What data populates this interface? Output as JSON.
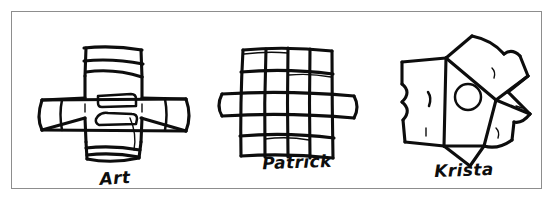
{
  "image": {
    "kind": "scanned-handdrawn-figure",
    "background_color": "#ffffff",
    "ink_color": "#0d0d0d",
    "frame_color": "#8d8d8d",
    "description": "Three hand-drawn puzzle-piece sketches in a thin rectangular frame, each with a handwritten name beneath it."
  },
  "figures": [
    {
      "id": "art",
      "caption": "Art",
      "shape": "plus-cross with horizontal bands and inner rounded rectangles"
    },
    {
      "id": "patrick",
      "caption": "Patrick",
      "shape": "four-by-four grid of squares with side tabs left and right"
    },
    {
      "id": "krista",
      "caption": "Krista",
      "shape": "irregular pinwheel star with a small circle near its center"
    }
  ]
}
